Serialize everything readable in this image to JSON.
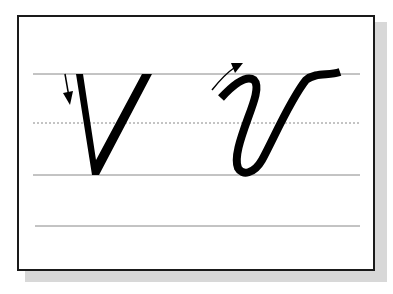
{
  "worksheet": {
    "subject": "letter-v-handwriting",
    "letters": [
      {
        "style": "print",
        "glyph": "v"
      },
      {
        "style": "cursive",
        "glyph": "v"
      }
    ],
    "colors": {
      "ink": "#000000",
      "frame": "#1a1a1a",
      "shadow": "#d8d8d8",
      "guide_line": "#888888"
    },
    "guide_lines": [
      {
        "type": "solid",
        "y": 74
      },
      {
        "type": "dotted",
        "y": 123
      },
      {
        "type": "solid",
        "y": 175
      },
      {
        "type": "solid",
        "y": 226
      }
    ]
  }
}
